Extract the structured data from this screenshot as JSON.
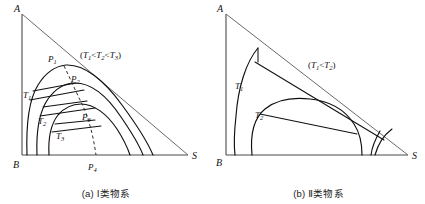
{
  "figure": {
    "title_implied": "Ternary phase diagrams of Type I and Type II systems",
    "panels": [
      {
        "id": "a",
        "caption": "(a) Ⅰ类物系",
        "condition_note": "(T1<T2<T3)",
        "vertices": {
          "top": "A",
          "bottom_left": "B",
          "bottom_right": "S"
        },
        "curve_labels": [
          "T1",
          "T2",
          "T3"
        ],
        "point_labels": [
          "P1",
          "P2",
          "P3",
          "P4"
        ],
        "dashed_line": "plait-point locus from P1 through P2, P3 to P4"
      },
      {
        "id": "b",
        "caption": "(b) Ⅱ类物系",
        "condition_note": "(T1<T2)",
        "vertices": {
          "top": "A",
          "bottom_left": "B",
          "bottom_right": "S"
        },
        "curve_labels": [
          "T1",
          "T2"
        ],
        "point_labels": []
      }
    ]
  },
  "panel_a": {
    "vertex_A": "A",
    "vertex_B": "B",
    "vertex_S": "S",
    "note_open": "(",
    "note_T1": "T",
    "note_T1_sub": "1",
    "note_lt1": "<",
    "note_T2": "T",
    "note_T2_sub": "2",
    "note_lt2": "<",
    "note_T3": "T",
    "note_T3_sub": "3",
    "note_close": ")",
    "curve1_base": "T",
    "curve1_sub": "1",
    "curve2_base": "T",
    "curve2_sub": "2",
    "curve3_base": "T",
    "curve3_sub": "3",
    "p1_base": "P",
    "p1_sub": "1",
    "p2_base": "P",
    "p2_sub": "2",
    "p3_base": "P",
    "p3_sub": "3",
    "p4_base": "P",
    "p4_sub": "4",
    "caption": "(a) Ⅰ类物系"
  },
  "panel_b": {
    "vertex_A": "A",
    "vertex_B": "B",
    "vertex_S": "S",
    "note_open": "(",
    "note_T1": "T",
    "note_T1_sub": "1",
    "note_lt1": "<",
    "note_T2": "T",
    "note_T2_sub": "2",
    "note_close": ")",
    "curve1_base": "T",
    "curve1_sub": "1",
    "curve2_base": "T",
    "curve2_sub": "2",
    "caption": "(b) Ⅱ类物系"
  },
  "colors": {
    "curve": "#101010",
    "axis": "#4a4a4a",
    "hypotenuse": "#6a6a6a",
    "text": "#111111",
    "background": "#ffffff"
  }
}
